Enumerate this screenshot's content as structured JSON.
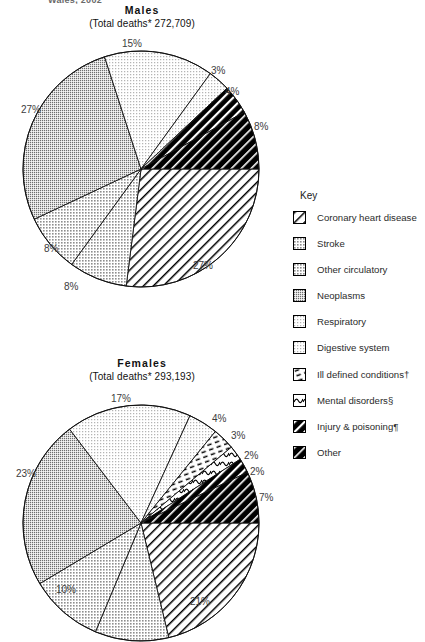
{
  "page": {
    "cut_off_header": "Wales, 2002"
  },
  "charts": [
    {
      "id": "males",
      "title": "Males",
      "subtitle": "(Total deaths* 272,709)",
      "labels": [
        {
          "text": "15%",
          "x": 122,
          "y": 38
        },
        {
          "text": "3%",
          "x": 211,
          "y": 65
        },
        {
          "text": "4%",
          "x": 225,
          "y": 86
        },
        {
          "text": "8%",
          "x": 254,
          "y": 121
        },
        {
          "text": "27%",
          "x": 193,
          "y": 260
        },
        {
          "text": "8%",
          "x": 64,
          "y": 281
        },
        {
          "text": "8%",
          "x": 44,
          "y": 243
        },
        {
          "text": "27%",
          "x": 21,
          "y": 104
        }
      ]
    },
    {
      "id": "females",
      "title": "Females",
      "subtitle": "(Total deaths* 293,193)",
      "labels": [
        {
          "text": "17%",
          "x": 111,
          "y": 393
        },
        {
          "text": "4%",
          "x": 212,
          "y": 413
        },
        {
          "text": "3%",
          "x": 231,
          "y": 430
        },
        {
          "text": "2%",
          "x": 244,
          "y": 450
        },
        {
          "text": "2%",
          "x": 250,
          "y": 466
        },
        {
          "text": "7%",
          "x": 259,
          "y": 492
        },
        {
          "text": "21%",
          "x": 190,
          "y": 596
        },
        {
          "text": "10%",
          "x": 56,
          "y": 584
        },
        {
          "text": "23%",
          "x": 16,
          "y": 468
        }
      ]
    }
  ],
  "legend": {
    "title": "Key",
    "items": [
      {
        "label": "Coronary heart disease",
        "pattern": "diag-line-white",
        "icon": "swatch-coronary-heart-disease"
      },
      {
        "label": "Stroke",
        "pattern": "dot-light",
        "icon": "swatch-stroke"
      },
      {
        "label": "Other circulatory",
        "pattern": "dot-light2",
        "icon": "swatch-other-circulatory"
      },
      {
        "label": "Neoplasms",
        "pattern": "dot-mid",
        "icon": "swatch-neoplasms"
      },
      {
        "label": "Respiratory",
        "pattern": "dot-vlight",
        "icon": "swatch-respiratory"
      },
      {
        "label": "Digestive system",
        "pattern": "dot-vlight2",
        "icon": "swatch-digestive-system"
      },
      {
        "label": "Ill defined conditions†",
        "pattern": "dash",
        "icon": "swatch-ill-defined-conditions"
      },
      {
        "label": "Mental disorders§",
        "pattern": "squiggle",
        "icon": "swatch-mental-disorders"
      },
      {
        "label": "Injury & poisoning¶",
        "pattern": "black-diag",
        "icon": "swatch-injury-poisoning"
      },
      {
        "label": "Other",
        "pattern": "black-diag2",
        "icon": "swatch-other"
      }
    ]
  },
  "chart_data": [
    {
      "type": "pie",
      "title": "Males",
      "subtitle": "(Total deaths* 272,709)",
      "categories": [
        "Coronary heart disease",
        "Stroke",
        "Other circulatory",
        "Neoplasms",
        "Respiratory",
        "Digestive system",
        "Ill defined conditions†",
        "Mental disorders§",
        "Injury & poisoning¶",
        "Other"
      ],
      "values": [
        27,
        8,
        8,
        27,
        15,
        3,
        0,
        0,
        4,
        8
      ],
      "unit": "%",
      "legend": "right",
      "start_angle_deg": 0,
      "direction": "clockwise"
    },
    {
      "type": "pie",
      "title": "Females",
      "subtitle": "(Total deaths* 293,193)",
      "categories": [
        "Coronary heart disease",
        "Stroke",
        "Other circulatory",
        "Neoplasms",
        "Respiratory",
        "Digestive system",
        "Ill defined conditions†",
        "Mental disorders§",
        "Injury & poisoning¶",
        "Other"
      ],
      "values": [
        21,
        10,
        10,
        23,
        17,
        4,
        3,
        2,
        2,
        7
      ],
      "unit": "%",
      "legend": "right",
      "start_angle_deg": 0,
      "direction": "clockwise"
    }
  ]
}
